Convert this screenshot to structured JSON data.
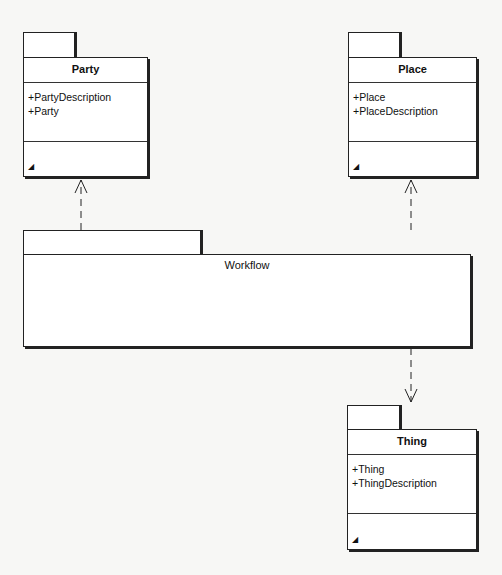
{
  "packages": {
    "party": {
      "name": "Party",
      "attributes": [
        "+PartyDescription",
        "+Party"
      ],
      "operation_icon": "operation-icon"
    },
    "place": {
      "name": "Place",
      "attributes": [
        "+Place",
        "+PlaceDescription"
      ],
      "operation_icon": "operation-icon"
    },
    "workflow": {
      "name": "Workflow"
    },
    "thing": {
      "name": "Thing",
      "attributes": [
        "+Thing",
        "+ThingDescription"
      ],
      "operation_icon": "operation-icon"
    }
  },
  "dependencies": [
    {
      "from": "Workflow",
      "to": "Party",
      "style": "dashed-open-arrow"
    },
    {
      "from": "Workflow",
      "to": "Place",
      "style": "dashed-open-arrow"
    },
    {
      "from": "Workflow",
      "to": "Thing",
      "style": "dashed-open-arrow"
    }
  ]
}
